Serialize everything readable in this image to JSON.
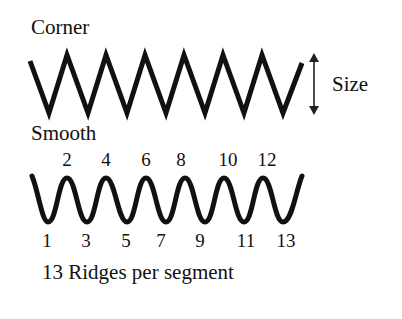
{
  "labels": {
    "corner": "Corner",
    "size": "Size",
    "smooth": "Smooth",
    "caption_count": "13",
    "caption_text": "Ridges per segment"
  },
  "smooth_wave": {
    "top_numbers": [
      "2",
      "4",
      "6",
      "8",
      "10",
      "12"
    ],
    "bottom_numbers": [
      "1",
      "3",
      "5",
      "7",
      "9",
      "11",
      "13"
    ]
  },
  "colors": {
    "stroke": "#111111",
    "background": "#ffffff"
  }
}
